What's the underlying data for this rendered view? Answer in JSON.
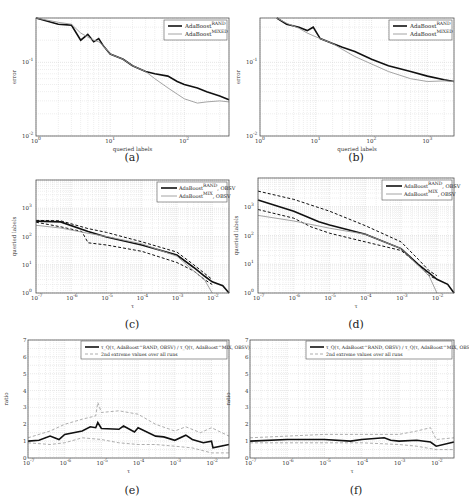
{
  "chart_data": [
    {
      "id": "a",
      "caption": "(a)",
      "type": "line",
      "xscale": "log",
      "yscale": "log",
      "xlabel": "queried labels",
      "ylabel": "error",
      "xlim": [
        1,
        400
      ],
      "ylim": [
        0.01,
        0.4
      ],
      "xticks": [
        "10^0",
        "10^1",
        "10^2"
      ],
      "yticks": [
        "10^-2",
        "10^-1"
      ],
      "grid": true,
      "legend_position": "upper right",
      "series": [
        {
          "name": "AdaBoost^RAND",
          "style": "thick-black",
          "x": [
            1,
            2,
            3,
            4,
            5,
            6,
            7,
            8,
            10,
            15,
            20,
            30,
            40,
            60,
            80,
            100,
            150,
            200,
            300,
            400
          ],
          "y": [
            0.4,
            0.33,
            0.32,
            0.2,
            0.24,
            0.19,
            0.21,
            0.17,
            0.13,
            0.11,
            0.09,
            0.075,
            0.07,
            0.065,
            0.055,
            0.05,
            0.045,
            0.04,
            0.035,
            0.031
          ]
        },
        {
          "name": "AdaBoost^MIXED",
          "style": "thin-gray",
          "x": [
            1,
            2,
            3,
            4,
            5,
            6,
            7,
            8,
            10,
            15,
            20,
            30,
            40,
            60,
            80,
            100,
            150,
            200,
            300,
            400
          ],
          "y": [
            0.4,
            0.35,
            0.33,
            0.25,
            0.22,
            0.2,
            0.19,
            0.17,
            0.13,
            0.11,
            0.09,
            0.075,
            0.06,
            0.045,
            0.037,
            0.032,
            0.028,
            0.029,
            0.03,
            0.029
          ]
        }
      ]
    },
    {
      "id": "b",
      "caption": "(b)",
      "type": "line",
      "xscale": "log",
      "yscale": "log",
      "xlabel": "queried labels",
      "ylabel": "error",
      "xlim": [
        1,
        3000
      ],
      "ylim": [
        0.01,
        0.4
      ],
      "xticks": [
        "10^0",
        "10^1",
        "10^2",
        "10^3"
      ],
      "yticks": [
        "10^-2",
        "10^-1"
      ],
      "grid": true,
      "legend_position": "upper right",
      "series": [
        {
          "name": "AdaBoost^RAND",
          "style": "thick-black",
          "x": [
            2,
            3,
            5,
            7,
            9,
            12,
            20,
            30,
            50,
            100,
            200,
            500,
            1000,
            2000,
            3000
          ],
          "y": [
            0.4,
            0.33,
            0.3,
            0.27,
            0.3,
            0.21,
            0.18,
            0.16,
            0.14,
            0.11,
            0.09,
            0.075,
            0.065,
            0.058,
            0.055
          ]
        },
        {
          "name": "AdaBoost^MIXED",
          "style": "thin-gray",
          "x": [
            2,
            3,
            5,
            7,
            9,
            12,
            20,
            30,
            50,
            100,
            200,
            500,
            1000,
            2000,
            3000
          ],
          "y": [
            0.4,
            0.34,
            0.29,
            0.25,
            0.23,
            0.21,
            0.18,
            0.15,
            0.12,
            0.095,
            0.075,
            0.06,
            0.055,
            0.056,
            0.055
          ]
        }
      ]
    },
    {
      "id": "c",
      "caption": "(c)",
      "type": "line",
      "xscale": "log",
      "yscale": "log",
      "xlabel": "τ",
      "ylabel": "queried labels",
      "xlim": [
        1e-07,
        0.03
      ],
      "ylim": [
        1,
        10000
      ],
      "xticks": [
        "10^-7",
        "10^-6",
        "10^-5",
        "10^-4",
        "10^-3",
        "10^-2"
      ],
      "yticks": [
        "10^0",
        "10^1",
        "10^2",
        "10^3"
      ],
      "grid": true,
      "legend_position": "upper right",
      "series": [
        {
          "name": "AdaBoost^RAND, OBSV",
          "style": "thick-black",
          "x": [
            1e-07,
            5e-07,
            3e-06,
            1e-05,
            0.0001,
            0.001,
            0.003,
            0.006,
            0.01,
            0.02,
            0.03
          ],
          "y": [
            350,
            330,
            150,
            95,
            50,
            22,
            8,
            4,
            2.5,
            1.8,
            1
          ]
        },
        {
          "name": "AdaBoost^RAND, OBSV (2nd extreme hi)",
          "style": "dashed-black",
          "x": [
            1e-07,
            5e-07,
            3e-06,
            1e-05,
            0.0001,
            0.001,
            0.003,
            0.006,
            0.01
          ],
          "y": [
            370,
            360,
            190,
            140,
            65,
            28,
            10,
            5,
            3
          ]
        },
        {
          "name": "AdaBoost^RAND, OBSV (2nd extreme lo)",
          "style": "dashed-black",
          "x": [
            1e-07,
            5e-07,
            2e-06,
            3e-06,
            1e-05,
            0.0001,
            0.001,
            0.003,
            0.006,
            0.01
          ],
          "y": [
            320,
            220,
            150,
            60,
            50,
            30,
            12,
            6,
            3,
            2
          ]
        },
        {
          "name": "AdaBoost^MIX, OBSV",
          "style": "thin-gray",
          "x": [
            1e-07,
            5e-07,
            3e-06,
            1e-05,
            0.0001,
            0.001,
            0.003,
            0.006,
            0.01
          ],
          "y": [
            250,
            200,
            130,
            100,
            55,
            20,
            6,
            3,
            1
          ]
        }
      ]
    },
    {
      "id": "d",
      "caption": "(d)",
      "type": "line",
      "xscale": "log",
      "yscale": "log",
      "xlabel": "τ",
      "ylabel": "queried labels",
      "xlim": [
        1e-07,
        0.03
      ],
      "ylim": [
        1,
        10000
      ],
      "xticks": [
        "10^-7",
        "10^-6",
        "10^-5",
        "10^-4",
        "10^-3",
        "10^-2"
      ],
      "yticks": [
        "10^0",
        "10^1",
        "10^2",
        "10^3"
      ],
      "grid": true,
      "legend_position": "upper right",
      "series": [
        {
          "name": "AdaBoost^RAND, OBSV",
          "style": "thick-black",
          "x": [
            1e-07,
            1e-06,
            5e-06,
            1e-05,
            0.0001,
            0.001,
            0.003,
            0.006,
            0.01,
            0.02,
            0.03
          ],
          "y": [
            1700,
            700,
            300,
            230,
            110,
            35,
            10,
            5,
            3,
            2,
            1
          ]
        },
        {
          "name": "AdaBoost^RAND, OBSV (2nd extreme hi)",
          "style": "dashed-black",
          "x": [
            1e-07,
            1e-06,
            1e-05,
            0.0001,
            0.001,
            0.003,
            0.006,
            0.01
          ],
          "y": [
            3500,
            1800,
            700,
            220,
            60,
            15,
            6,
            4
          ]
        },
        {
          "name": "AdaBoost^RAND, OBSV (2nd extreme lo)",
          "style": "dashed-black",
          "x": [
            1e-07,
            1e-06,
            3e-06,
            1e-05,
            0.0001,
            0.001,
            0.003,
            0.006,
            0.01
          ],
          "y": [
            800,
            400,
            200,
            120,
            60,
            30,
            10,
            4,
            3
          ]
        },
        {
          "name": "AdaBoost^MIX, OBSV",
          "style": "thin-gray",
          "x": [
            1e-07,
            1e-06,
            1e-05,
            0.0001,
            0.001,
            0.003,
            0.006,
            0.01
          ],
          "y": [
            500,
            320,
            180,
            110,
            35,
            9,
            4,
            1
          ]
        }
      ]
    },
    {
      "id": "e",
      "caption": "(e)",
      "type": "line",
      "xscale": "log",
      "yscale": "linear",
      "xlabel": "τ",
      "ylabel": "ratio",
      "xlim": [
        1e-07,
        0.03
      ],
      "ylim": [
        0,
        7
      ],
      "xticks": [
        "10^-7",
        "10^-6",
        "10^-5",
        "10^-4",
        "10^-3",
        "10^-2"
      ],
      "yticks": [
        "0",
        "1",
        "2",
        "3",
        "4",
        "5",
        "6",
        "7"
      ],
      "grid": true,
      "legend_position": "upper right",
      "series": [
        {
          "name": "τ_Q(τ, AdaBoost^RAND, OBSV) / τ_Q(τ, AdaBoost^MIX, OBSV)",
          "style": "thick-black",
          "x": [
            1e-07,
            2e-07,
            4e-07,
            7e-07,
            1e-06,
            3e-06,
            5e-06,
            7e-06,
            8e-06,
            1e-05,
            3e-05,
            4e-05,
            8e-05,
            0.0001,
            0.0003,
            0.0005,
            0.001,
            0.002,
            0.003,
            0.006,
            0.01,
            0.011,
            0.03
          ],
          "y": [
            1.0,
            1.05,
            1.3,
            1.1,
            1.4,
            1.6,
            1.85,
            1.8,
            2.1,
            1.75,
            1.7,
            1.9,
            1.55,
            1.8,
            1.3,
            1.25,
            1.05,
            1.35,
            1.1,
            0.9,
            1.0,
            0.6,
            0.8
          ]
        },
        {
          "name": "2nd extreme values over all runs (upper)",
          "style": "dashed-gray",
          "x": [
            1e-07,
            4e-07,
            1e-06,
            3e-06,
            7e-06,
            8e-06,
            1e-05,
            3e-05,
            0.0001,
            0.0003,
            0.001,
            0.002,
            0.005,
            0.01,
            0.03
          ],
          "y": [
            1.2,
            1.6,
            2.0,
            2.3,
            2.5,
            3.3,
            2.7,
            2.8,
            2.6,
            2.0,
            1.6,
            1.85,
            1.5,
            1.8,
            1.3
          ]
        },
        {
          "name": "2nd extreme values over all runs (lower)",
          "style": "dashed-gray",
          "x": [
            1e-07,
            4e-07,
            1e-06,
            3e-06,
            1e-05,
            3e-05,
            0.0001,
            0.0003,
            0.001,
            0.003,
            0.01,
            0.03
          ],
          "y": [
            0.9,
            0.8,
            0.9,
            1.2,
            1.1,
            0.9,
            0.8,
            0.8,
            0.7,
            0.6,
            0.3,
            0.3
          ]
        }
      ]
    },
    {
      "id": "f",
      "caption": "(f)",
      "type": "line",
      "xscale": "log",
      "yscale": "linear",
      "xlabel": "τ",
      "ylabel": "ratio",
      "xlim": [
        1e-07,
        0.03
      ],
      "ylim": [
        0,
        7
      ],
      "xticks": [
        "10^-7",
        "10^-6",
        "10^-5",
        "10^-4",
        "10^-3",
        "10^-2"
      ],
      "yticks": [
        "0",
        "1",
        "2",
        "3",
        "4",
        "5",
        "6",
        "7"
      ],
      "grid": true,
      "legend_position": "upper right",
      "series": [
        {
          "name": "τ_Q(τ, AdaBoost^RAND, OBSV) / τ_Q(τ, AdaBoost^MIX, OBSV)",
          "style": "thick-black",
          "x": [
            1e-07,
            1e-06,
            1e-05,
            5e-05,
            0.0001,
            0.0004,
            0.0006,
            0.001,
            0.003,
            0.007,
            0.01,
            0.03
          ],
          "y": [
            1.0,
            1.1,
            1.1,
            1.0,
            1.1,
            1.2,
            1.05,
            1.0,
            1.05,
            0.95,
            0.7,
            0.95
          ]
        },
        {
          "name": "2nd extreme values over all runs (upper)",
          "style": "dashed-gray",
          "x": [
            1e-07,
            1e-06,
            1e-05,
            0.0001,
            0.001,
            0.003,
            0.007,
            0.01,
            0.03
          ],
          "y": [
            1.2,
            1.3,
            1.4,
            1.4,
            1.4,
            1.6,
            1.8,
            1.1,
            1.2
          ]
        },
        {
          "name": "2nd extreme values over all runs (lower)",
          "style": "dashed-gray",
          "x": [
            1e-07,
            1e-06,
            1e-05,
            0.0001,
            0.001,
            0.003,
            0.01,
            0.03
          ],
          "y": [
            0.9,
            0.9,
            0.9,
            0.9,
            0.8,
            0.7,
            0.5,
            0.5
          ]
        }
      ]
    }
  ],
  "labels": {
    "legend_a": [
      "AdaBoost",
      "RAND",
      "AdaBoost",
      "MIXED"
    ],
    "legend_cd": [
      "AdaBoost",
      "RAND",
      ", OBSV",
      "AdaBoost",
      "MIX",
      ", OBSV"
    ],
    "legend_ef_line": "τ_Q(τ, AdaBoost^RAND, OBSV) / τ_Q(τ, AdaBoost^MIX, OBSV)",
    "legend_ef_dash": "2nd extreme values over all runs"
  },
  "colors": {
    "black": "#111111",
    "gray": "#9a9a9a",
    "grid": "#d4d4d4",
    "frame": "#555555"
  }
}
